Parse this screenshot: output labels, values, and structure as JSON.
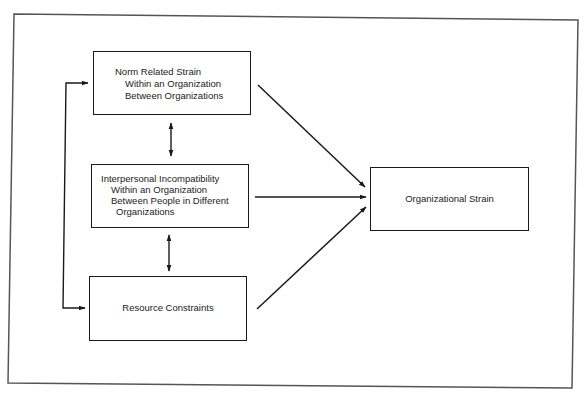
{
  "diagram": {
    "type": "flow",
    "nodes": [
      {
        "id": "norm",
        "title": "Norm Related Strain",
        "lines": [
          "Within an Organization",
          "Between Organizations"
        ]
      },
      {
        "id": "interpersonal",
        "title": "Interpersonal Incompatibility",
        "lines": [
          "Within an Organization",
          "Between People in Different",
          "Organizations"
        ]
      },
      {
        "id": "resource",
        "title": "Resource Constraints",
        "lines": []
      },
      {
        "id": "org_strain",
        "title": "Organizational Strain",
        "lines": []
      }
    ],
    "edges": [
      {
        "from": "norm",
        "to": "org_strain",
        "type": "directed"
      },
      {
        "from": "interpersonal",
        "to": "org_strain",
        "type": "directed"
      },
      {
        "from": "resource",
        "to": "org_strain",
        "type": "directed"
      },
      {
        "from": "norm",
        "to": "interpersonal",
        "type": "bidirectional"
      },
      {
        "from": "interpersonal",
        "to": "resource",
        "type": "bidirectional"
      },
      {
        "from": "norm",
        "to": "resource",
        "type": "bidirectional",
        "route": "left-bracket"
      }
    ]
  },
  "colors": {
    "line": "#1a1a1a",
    "frame": "#555555",
    "background": "#ffffff"
  }
}
